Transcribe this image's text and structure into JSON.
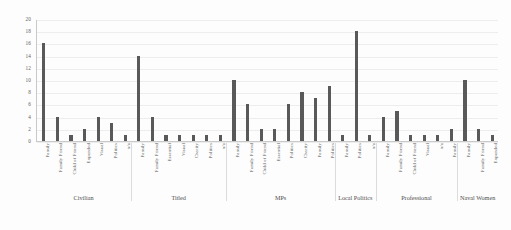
{
  "chart_data": {
    "type": "bar",
    "title": "",
    "subtitle": "",
    "xlabel": "",
    "ylabel": "",
    "ylim": [
      0,
      20
    ],
    "ytick_step": 2,
    "yticks": [
      "0",
      "2",
      "4",
      "6",
      "8",
      "10",
      "12",
      "14",
      "16",
      "18",
      "20"
    ],
    "grid": true,
    "legend": "none",
    "bar_color": "#595959",
    "categories": [
      "Family",
      "Family Friend",
      "Child of Friend",
      "Expanded",
      "Visual",
      "Politics",
      "n/a",
      "Family",
      "Family Friend",
      "Essential",
      "Visual",
      "Charity",
      "Politics",
      "n/a",
      "Family",
      "Family Friend",
      "Child of Friend",
      "Essential",
      "Politics",
      "Charity",
      "Family",
      "Politics",
      "Family",
      "Politics",
      "n/a",
      "Family",
      "Family Friend",
      "Child of Friend",
      "Visual",
      "n/a",
      "Family",
      "Family",
      "Family Friend",
      "Expanded"
    ],
    "values": [
      16,
      4,
      1,
      2,
      4,
      3,
      1,
      14,
      4,
      1,
      1,
      1,
      1,
      1,
      10,
      6,
      2,
      2,
      6,
      8,
      7,
      9,
      1,
      18,
      1,
      4,
      5,
      1,
      1,
      1,
      2,
      10,
      2,
      1
    ],
    "groups": [
      {
        "label": "Civilian",
        "count": 7
      },
      {
        "label": "Titled",
        "count": 7
      },
      {
        "label": "MPs",
        "count": 8
      },
      {
        "label": "Local Politics",
        "count": 3
      },
      {
        "label": "Professional",
        "count": 6
      },
      {
        "label": "Naval Women",
        "count": 3
      }
    ]
  }
}
